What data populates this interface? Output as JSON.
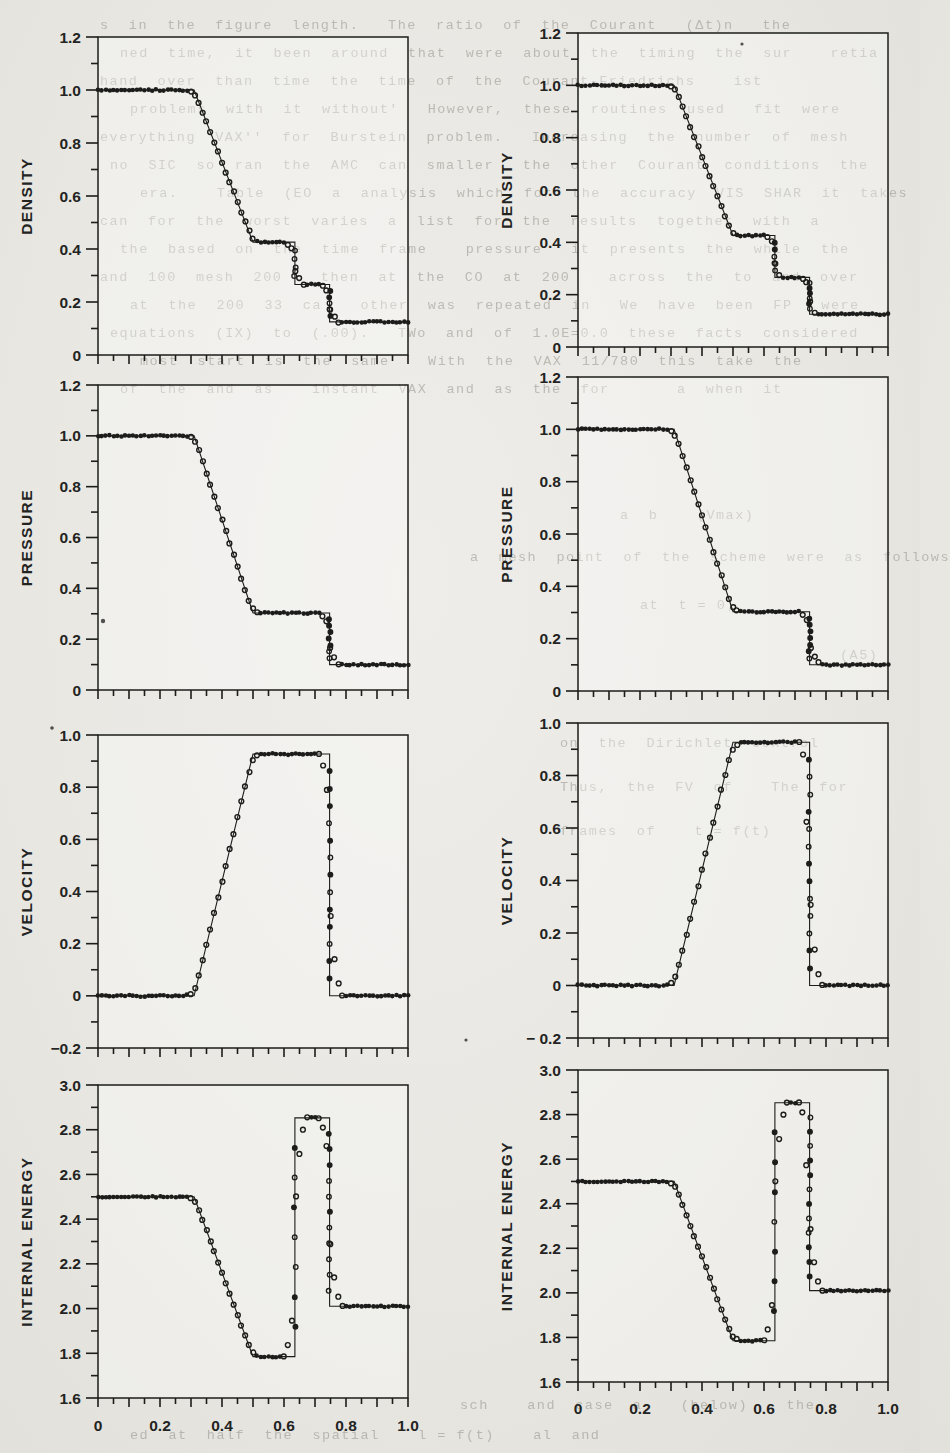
{
  "style": {
    "paper": "#e8e7e2",
    "ink": "#1c1c1a",
    "box_fill": "rgba(255,255,255,0.35)",
    "bleed_color": "rgba(118,115,104,0.40)"
  },
  "figure": {
    "arrangement": "4 rows x 2 columns of panels",
    "legend": "solid line = exact solution, circles = numerical solution"
  },
  "x_axis": {
    "lim": [
      0,
      1
    ],
    "tick_step_minor": 0.05,
    "tick_step_mid": 0.1,
    "label_step": 0.2,
    "labels": [
      "0",
      "0.2",
      "0.4",
      "0.6",
      "0.8",
      "1.0"
    ]
  },
  "chart_data": [
    {
      "id": "density-left",
      "type": "line+scatter",
      "ylabel": "DENSITY",
      "ylim": [
        0,
        1.2
      ],
      "ytick_labels": [
        "0",
        "0.2",
        "0.4",
        "0.6",
        "0.8",
        "1.0",
        "1.2"
      ],
      "box": {
        "left": 98,
        "top": 37,
        "right": 408,
        "bottom": 355
      },
      "show_x_labels": false,
      "x_label_y": 0,
      "exact": [
        [
          0,
          1
        ],
        [
          0.31,
          1
        ],
        [
          0.5,
          0.426
        ],
        [
          0.635,
          0.426
        ],
        [
          0.635,
          0.266
        ],
        [
          0.747,
          0.266
        ],
        [
          0.747,
          0.125
        ],
        [
          1,
          0.125
        ]
      ],
      "smear": 0.013,
      "jitter": 0.006,
      "marker_step": 0.0125,
      "columns": [
        {
          "x": 0.635,
          "n": 4
        },
        {
          "x": 0.747,
          "n": 5
        }
      ]
    },
    {
      "id": "density-right",
      "type": "line+scatter",
      "ylabel": "DENSITY",
      "ylim": [
        0,
        1.2
      ],
      "ytick_labels": [
        "0",
        "0.2",
        "0.4",
        "0.6",
        "0.8",
        "1.0",
        "1.2"
      ],
      "box": {
        "left": 578,
        "top": 33,
        "right": 888,
        "bottom": 347
      },
      "show_x_labels": false,
      "x_label_y": 0,
      "exact": [
        [
          0,
          1
        ],
        [
          0.31,
          1
        ],
        [
          0.5,
          0.426
        ],
        [
          0.635,
          0.426
        ],
        [
          0.635,
          0.266
        ],
        [
          0.747,
          0.266
        ],
        [
          0.747,
          0.125
        ],
        [
          1,
          0.125
        ]
      ],
      "smear": 0.012,
      "jitter": 0.006,
      "marker_step": 0.0125,
      "columns": [
        {
          "x": 0.635,
          "n": 5
        },
        {
          "x": 0.747,
          "n": 6
        }
      ]
    },
    {
      "id": "pressure-left",
      "type": "line+scatter",
      "ylabel": "PRESSURE",
      "ylim": [
        0,
        1.2
      ],
      "ytick_labels": [
        "0",
        "0.2",
        "0.4",
        "0.6",
        "0.8",
        "1.0",
        "1.2"
      ],
      "box": {
        "left": 98,
        "top": 385,
        "right": 408,
        "bottom": 690
      },
      "show_x_labels": false,
      "x_label_y": 0,
      "exact": [
        [
          0,
          1
        ],
        [
          0.31,
          1
        ],
        [
          0.5,
          0.303
        ],
        [
          0.747,
          0.303
        ],
        [
          0.747,
          0.1
        ],
        [
          1,
          0.1
        ]
      ],
      "smear": 0.013,
      "jitter": 0.006,
      "marker_step": 0.0125,
      "columns": [
        {
          "x": 0.747,
          "n": 7
        }
      ]
    },
    {
      "id": "pressure-right",
      "type": "line+scatter",
      "ylabel": "PRESSURE",
      "ylim": [
        0,
        1.2
      ],
      "ytick_labels": [
        "0",
        "0.2",
        "0.4",
        "0.6",
        "0.8",
        "1.0",
        "1.2"
      ],
      "box": {
        "left": 578,
        "top": 377,
        "right": 888,
        "bottom": 691
      },
      "show_x_labels": false,
      "x_label_y": 0,
      "exact": [
        [
          0,
          1
        ],
        [
          0.31,
          1
        ],
        [
          0.5,
          0.303
        ],
        [
          0.747,
          0.303
        ],
        [
          0.747,
          0.1
        ],
        [
          1,
          0.1
        ]
      ],
      "smear": 0.014,
      "jitter": 0.006,
      "marker_step": 0.0125,
      "columns": [
        {
          "x": 0.747,
          "n": 7
        }
      ]
    },
    {
      "id": "velocity-left",
      "type": "line+scatter",
      "ylabel": "VELOCITY",
      "ylim": [
        -0.2,
        1.0
      ],
      "ytick_labels": [
        "−0.2",
        "0",
        "0.2",
        "0.4",
        "0.6",
        "0.8",
        "1.0"
      ],
      "box": {
        "left": 98,
        "top": 735,
        "right": 408,
        "bottom": 1048
      },
      "show_x_labels": false,
      "x_label_y": 0,
      "exact": [
        [
          0,
          0
        ],
        [
          0.31,
          0
        ],
        [
          0.5,
          0.927
        ],
        [
          0.747,
          0.927
        ],
        [
          0.747,
          0
        ],
        [
          1,
          0
        ]
      ],
      "smear": 0.015,
      "jitter": 0.007,
      "marker_step": 0.0125,
      "columns": [
        {
          "x": 0.747,
          "n": 13
        }
      ]
    },
    {
      "id": "velocity-right",
      "type": "line+scatter",
      "ylabel": "VELOCITY",
      "ylim": [
        -0.2,
        1.0
      ],
      "ytick_labels": [
        "− 0.2",
        "0",
        "0.2",
        "0.4",
        "0.6",
        "0.8",
        "1.0"
      ],
      "box": {
        "left": 578,
        "top": 723,
        "right": 888,
        "bottom": 1038
      },
      "show_x_labels": false,
      "x_label_y": 0,
      "exact": [
        [
          0,
          0
        ],
        [
          0.31,
          0
        ],
        [
          0.5,
          0.927
        ],
        [
          0.747,
          0.927
        ],
        [
          0.747,
          0
        ],
        [
          1,
          0
        ]
      ],
      "smear": 0.017,
      "jitter": 0.007,
      "marker_step": 0.0125,
      "columns": [
        {
          "x": 0.747,
          "n": 13
        }
      ]
    },
    {
      "id": "internal-energy-left",
      "type": "line+scatter",
      "ylabel": "INTERNAL ENERGY",
      "ylim": [
        1.6,
        3.0
      ],
      "ytick_labels": [
        "1.6",
        "1.8",
        "2.0",
        "2.2",
        "2.4",
        "2.6",
        "2.8",
        "3.0"
      ],
      "box": {
        "left": 98,
        "top": 1085,
        "right": 408,
        "bottom": 1398
      },
      "show_x_labels": true,
      "x_label_y": 1431,
      "exact": [
        [
          0,
          2.5
        ],
        [
          0.31,
          2.5
        ],
        [
          0.5,
          1.785
        ],
        [
          0.635,
          1.785
        ],
        [
          0.635,
          2.853
        ],
        [
          0.747,
          2.853
        ],
        [
          0.747,
          2.01
        ],
        [
          1,
          2.01
        ]
      ],
      "smear": 0.014,
      "jitter": 0.005,
      "marker_step": 0.0125,
      "columns": [
        {
          "x": 0.635,
          "n": 7
        },
        {
          "x": 0.747,
          "n": 11
        }
      ]
    },
    {
      "id": "internal-energy-right",
      "type": "line+scatter",
      "ylabel": "INTERNAL ENERGY",
      "ylim": [
        1.6,
        3.0
      ],
      "ytick_labels": [
        "1.6",
        "1.8",
        "2.0",
        "2.2",
        "2.4",
        "2.6",
        "2.8",
        "3.0"
      ],
      "box": {
        "left": 578,
        "top": 1070,
        "right": 888,
        "bottom": 1382
      },
      "show_x_labels": true,
      "x_label_y": 1414,
      "exact": [
        [
          0,
          2.5
        ],
        [
          0.31,
          2.5
        ],
        [
          0.5,
          1.785
        ],
        [
          0.635,
          1.785
        ],
        [
          0.635,
          2.853
        ],
        [
          0.747,
          2.853
        ],
        [
          0.747,
          2.01
        ],
        [
          1,
          2.01
        ]
      ],
      "smear": 0.016,
      "jitter": 0.005,
      "marker_step": 0.0125,
      "columns": [
        {
          "x": 0.635,
          "n": 7
        },
        {
          "x": 0.747,
          "n": 12
        }
      ]
    }
  ],
  "bleedthrough": {
    "lines": [
      {
        "x": 100,
        "y": 30,
        "text": "s  in  the  figure  length.   The  ratio  of  the  Courant   (Δt)n   the"
      },
      {
        "x": 120,
        "y": 58,
        "text": "ned  time,  it  been  around  that  were  about  the  timing  the  sur    retia"
      },
      {
        "x": 100,
        "y": 86,
        "text": "hand  over  than  time  the  time  of  the  Courant-Friedrichs    ist"
      },
      {
        "x": 130,
        "y": 114,
        "text": "problems  with  it  without'   However,  these  routines  used   fit  were"
      },
      {
        "x": 100,
        "y": 142,
        "text": "everything  VAX''  for  Burstein  problem.   Increasing  the  number  of  mesh"
      },
      {
        "x": 110,
        "y": 170,
        "text": "no  SIC  so  ran  the  AMC  can  smaller   the  other  Courant  conditions  the"
      },
      {
        "x": 140,
        "y": 198,
        "text": "era.    Table  (EO  a  analysis  which  for  the  accuracy  VIS  SHAR  it  takes"
      },
      {
        "x": 100,
        "y": 226,
        "text": "can  for  the  worst  varies  a  list  for  the  results  together  with  a"
      },
      {
        "x": 120,
        "y": 254,
        "text": "the  based  on  the  time  frame    pressure   it  presents  the  while  the"
      },
      {
        "x": 100,
        "y": 282,
        "text": "and  100  mesh  200    then  at  the  CO  at  200    across  the  to  and  over"
      },
      {
        "x": 130,
        "y": 310,
        "text": "at  the  200  33  ca    other  was  repeated  in   We  have  been  FP   were"
      },
      {
        "x": 110,
        "y": 338,
        "text": "equations  (IX)  to  (.00).   TWo  and  of  1.0E=0.0  these  facts  considered"
      },
      {
        "x": 140,
        "y": 366,
        "text": "most  start  is  the  same    With  the  VAX  11/780  this  take  the"
      },
      {
        "x": 120,
        "y": 394,
        "text": "of  the  and  as    instant  VAX  and  as  the  for       a  when  it"
      },
      {
        "x": 620,
        "y": 520,
        "text": "a  b    (Vmax)"
      },
      {
        "x": 470,
        "y": 562,
        "text": "a  mesh  point  of  the  scheme  were  as  follows"
      },
      {
        "x": 640,
        "y": 610,
        "text": "at  t = 0;"
      },
      {
        "x": 840,
        "y": 660,
        "text": "(A5)"
      },
      {
        "x": 560,
        "y": 748,
        "text": "on  the  Dirichlet  control"
      },
      {
        "x": 560,
        "y": 792,
        "text": "Thus,  the  FV  of    The  for"
      },
      {
        "x": 560,
        "y": 836,
        "text": "frames  of    t = f(t)"
      },
      {
        "x": 460,
        "y": 1410,
        "text": "sch    and  case  a    (below)    the"
      },
      {
        "x": 130,
        "y": 1440,
        "text": "ed  at  half  the  spatial    l = f(t)    al  and"
      }
    ]
  },
  "specks": [
    {
      "x": 103,
      "y": 621,
      "r": 2.2
    },
    {
      "x": 466,
      "y": 1040,
      "r": 1.6
    },
    {
      "x": 742,
      "y": 44,
      "r": 1.6
    },
    {
      "x": 52,
      "y": 728,
      "r": 1.8
    }
  ]
}
